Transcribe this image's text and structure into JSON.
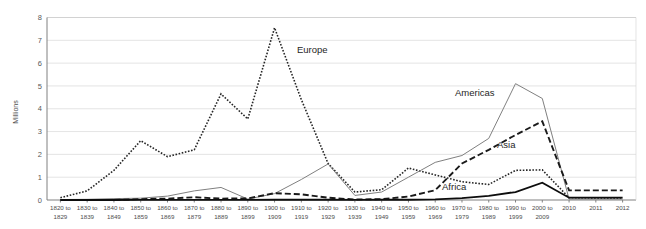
{
  "chart_data": {
    "type": "line",
    "title": "",
    "subtitle": "",
    "xlabel": "",
    "ylabel": "Millions",
    "ylim": [
      0,
      8
    ],
    "yticks": [
      0,
      1,
      2,
      3,
      4,
      5,
      6,
      7,
      8
    ],
    "ytick_labels": [
      "0",
      "1",
      "2",
      "3",
      "4",
      "5",
      "6",
      "7",
      "8"
    ],
    "grid": true,
    "legend_position": "inline-annotations",
    "categories": [
      "1820 to\n1829",
      "1830 to\n1839",
      "1840 to\n1849",
      "1850 to\n1859",
      "1860 to\n1869",
      "1870 to\n1879",
      "1880 to\n1889",
      "1890 to\n1899",
      "1900 to\n1909",
      "1910 to\n1919",
      "1920 to\n1929",
      "1930 to\n1939",
      "1940 to\n1949",
      "1950 to\n1959",
      "1960 to\n1969",
      "1970 to\n1979",
      "1980 to\n1989",
      "1990 to\n1999",
      "2000 to\n2009",
      "2010",
      "2011",
      "2012"
    ],
    "category_lines": [
      [
        "1820 to",
        "1829"
      ],
      [
        "1830 to",
        "1839"
      ],
      [
        "1840 to",
        "1849"
      ],
      [
        "1850 to",
        "1859"
      ],
      [
        "1860 to",
        "1869"
      ],
      [
        "1870 to",
        "1879"
      ],
      [
        "1880 to",
        "1889"
      ],
      [
        "1890 to",
        "1899"
      ],
      [
        "1900 to",
        "1909"
      ],
      [
        "1910 to",
        "1919"
      ],
      [
        "1920 to",
        "1929"
      ],
      [
        "1930 to",
        "1939"
      ],
      [
        "1940 to",
        "1949"
      ],
      [
        "1950 to",
        "1959"
      ],
      [
        "1960 to",
        "1969"
      ],
      [
        "1970 to",
        "1979"
      ],
      [
        "1980 to",
        "1989"
      ],
      [
        "1990 to",
        "1999"
      ],
      [
        "2000 to",
        "2009"
      ],
      [
        "2010",
        ""
      ],
      [
        "2011",
        ""
      ],
      [
        "2012",
        ""
      ]
    ],
    "series": [
      {
        "name": "Europe",
        "style": "dotted",
        "color": "#262626",
        "width": 1.6,
        "dasharray": "1.6,1.6",
        "label_x": 297,
        "label_y": 53,
        "values": [
          0.1,
          0.4,
          1.3,
          2.6,
          1.9,
          2.2,
          4.65,
          3.55,
          7.55,
          4.4,
          1.6,
          0.35,
          0.45,
          1.4,
          1.1,
          0.8,
          0.68,
          1.3,
          1.32,
          0.1,
          0.08,
          0.08
        ]
      },
      {
        "name": "Americas",
        "style": "solid-thin",
        "color": "#808080",
        "width": 1.0,
        "dasharray": "",
        "label_x": 455,
        "label_y": 96,
        "values": [
          0.02,
          0.03,
          0.06,
          0.08,
          0.17,
          0.4,
          0.55,
          0.04,
          0.28,
          0.9,
          1.58,
          0.2,
          0.35,
          1.0,
          1.65,
          1.95,
          2.7,
          5.1,
          4.45,
          0.04,
          0.04,
          0.04
        ]
      },
      {
        "name": "Asia",
        "style": "dashed",
        "color": "#1a1a1a",
        "width": 1.9,
        "dasharray": "6,3",
        "label_x": 497,
        "label_y": 148,
        "values": [
          0.005,
          0.005,
          0.005,
          0.04,
          0.06,
          0.12,
          0.06,
          0.07,
          0.3,
          0.25,
          0.1,
          0.02,
          0.04,
          0.15,
          0.43,
          1.6,
          2.2,
          2.85,
          3.45,
          0.42,
          0.42,
          0.42
        ]
      },
      {
        "name": "Africa",
        "style": "solid-thick",
        "color": "#0d0d0d",
        "width": 1.8,
        "dasharray": "",
        "label_x": 442,
        "label_y": 190,
        "values": [
          0.001,
          0.001,
          0.001,
          0.002,
          0.003,
          0.004,
          0.003,
          0.004,
          0.01,
          0.01,
          0.01,
          0.002,
          0.01,
          0.01,
          0.03,
          0.08,
          0.18,
          0.35,
          0.76,
          0.1,
          0.1,
          0.1
        ]
      }
    ]
  },
  "axis": {
    "y_title": "Millions"
  }
}
